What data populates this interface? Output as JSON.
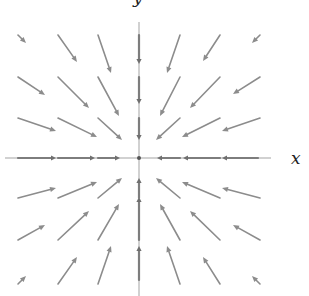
{
  "figure": {
    "x_axis_label": "x",
    "y_axis_label": "y",
    "origin": [
      139,
      158
    ],
    "colors": {
      "axis": "#a3a3a3",
      "axis_arrow": "#7d7d7d",
      "vector": "#8c8c8c",
      "label": "#222222"
    }
  },
  "axes": {
    "horizontal": {
      "x1": 5,
      "y1": 158,
      "x2": 271,
      "y2": 158
    },
    "vertical": {
      "x1": 139,
      "y1": 22,
      "x2": 139,
      "y2": 296
    }
  },
  "vectors": [
    {
      "from": [
        18,
        35
      ],
      "to": [
        26,
        43
      ]
    },
    {
      "from": [
        58,
        35
      ],
      "to": [
        77,
        62
      ]
    },
    {
      "from": [
        98,
        35
      ],
      "to": [
        111,
        73
      ]
    },
    {
      "from": [
        180,
        35
      ],
      "to": [
        167,
        73
      ]
    },
    {
      "from": [
        220,
        35
      ],
      "to": [
        203,
        61
      ]
    },
    {
      "from": [
        260,
        35
      ],
      "to": [
        252,
        43
      ]
    },
    {
      "from": [
        18,
        77
      ],
      "to": [
        45,
        95
      ]
    },
    {
      "from": [
        58,
        77
      ],
      "to": [
        89,
        108
      ]
    },
    {
      "from": [
        98,
        77
      ],
      "to": [
        119,
        116
      ]
    },
    {
      "from": [
        180,
        77
      ],
      "to": [
        160,
        116
      ]
    },
    {
      "from": [
        220,
        77
      ],
      "to": [
        190,
        108
      ]
    },
    {
      "from": [
        260,
        77
      ],
      "to": [
        233,
        94
      ]
    },
    {
      "from": [
        18,
        118
      ],
      "to": [
        56,
        131
      ]
    },
    {
      "from": [
        58,
        118
      ],
      "to": [
        97,
        137
      ]
    },
    {
      "from": [
        98,
        118
      ],
      "to": [
        122,
        140
      ]
    },
    {
      "from": [
        180,
        118
      ],
      "to": [
        156,
        140
      ]
    },
    {
      "from": [
        220,
        118
      ],
      "to": [
        182,
        137
      ]
    },
    {
      "from": [
        260,
        118
      ],
      "to": [
        222,
        131
      ]
    },
    {
      "from": [
        18,
        198
      ],
      "to": [
        56,
        188
      ]
    },
    {
      "from": [
        58,
        198
      ],
      "to": [
        97,
        182
      ]
    },
    {
      "from": [
        98,
        198
      ],
      "to": [
        122,
        178
      ]
    },
    {
      "from": [
        180,
        198
      ],
      "to": [
        156,
        178
      ]
    },
    {
      "from": [
        220,
        198
      ],
      "to": [
        182,
        182
      ]
    },
    {
      "from": [
        260,
        198
      ],
      "to": [
        222,
        188
      ]
    },
    {
      "from": [
        18,
        240
      ],
      "to": [
        45,
        225
      ]
    },
    {
      "from": [
        58,
        240
      ],
      "to": [
        89,
        211
      ]
    },
    {
      "from": [
        98,
        240
      ],
      "to": [
        119,
        204
      ]
    },
    {
      "from": [
        180,
        240
      ],
      "to": [
        160,
        204
      ]
    },
    {
      "from": [
        220,
        240
      ],
      "to": [
        190,
        211
      ]
    },
    {
      "from": [
        260,
        240
      ],
      "to": [
        233,
        225
      ]
    },
    {
      "from": [
        18,
        284
      ],
      "to": [
        26,
        276
      ]
    },
    {
      "from": [
        58,
        284
      ],
      "to": [
        77,
        257
      ]
    },
    {
      "from": [
        98,
        284
      ],
      "to": [
        111,
        246
      ]
    },
    {
      "from": [
        180,
        284
      ],
      "to": [
        167,
        246
      ]
    },
    {
      "from": [
        220,
        284
      ],
      "to": [
        203,
        257
      ]
    },
    {
      "from": [
        260,
        284
      ],
      "to": [
        252,
        276
      ]
    }
  ],
  "axis_vectors": [
    {
      "from": [
        139,
        35
      ],
      "to": [
        139,
        64
      ]
    },
    {
      "from": [
        139,
        77
      ],
      "to": [
        139,
        104
      ]
    },
    {
      "from": [
        139,
        118
      ],
      "to": [
        139,
        140
      ]
    },
    {
      "from": [
        139,
        280
      ],
      "to": [
        139,
        246
      ]
    },
    {
      "from": [
        139,
        240
      ],
      "to": [
        139,
        197
      ]
    },
    {
      "from": [
        139,
        198
      ],
      "to": [
        139,
        178
      ]
    },
    {
      "from": [
        18,
        158
      ],
      "to": [
        56,
        158
      ]
    },
    {
      "from": [
        58,
        158
      ],
      "to": [
        95,
        158
      ]
    },
    {
      "from": [
        98,
        158
      ],
      "to": [
        120,
        158
      ]
    },
    {
      "from": [
        258,
        158
      ],
      "to": [
        222,
        158
      ]
    },
    {
      "from": [
        220,
        158
      ],
      "to": [
        183,
        158
      ]
    },
    {
      "from": [
        180,
        158
      ],
      "to": [
        157,
        158
      ]
    }
  ]
}
